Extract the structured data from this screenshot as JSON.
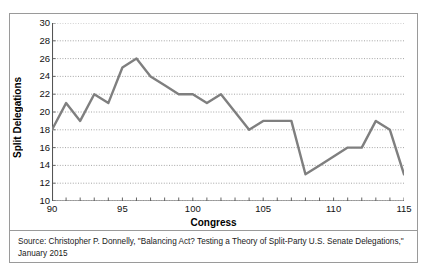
{
  "figure": {
    "source_note": "Source: Christopher P. Donnelly, \"Balancing Act? Testing a Theory of Split-Party U.S. Senate Delegations,\" January 2015"
  },
  "chart_data": {
    "type": "line",
    "title": "",
    "xlabel": "Congress",
    "ylabel": "Split Delegations",
    "xlim": [
      90,
      115
    ],
    "ylim": [
      10,
      30
    ],
    "ytick_step": 2,
    "xtick_step": 1,
    "xtick_label_step": 5,
    "grid": true,
    "grid_axis": "y",
    "legend": false,
    "line_color": "#7f7f7f",
    "grid_color": "#808080",
    "axis_color": "#555555",
    "x": [
      90,
      91,
      92,
      93,
      94,
      95,
      96,
      97,
      98,
      99,
      100,
      101,
      102,
      103,
      104,
      105,
      106,
      107,
      108,
      109,
      110,
      111,
      112,
      113,
      114,
      115
    ],
    "values": [
      18,
      21,
      19,
      22,
      21,
      25,
      26,
      24,
      23,
      22,
      22,
      21,
      22,
      20,
      18,
      19,
      19,
      19,
      13,
      14,
      15,
      16,
      16,
      19,
      18,
      13
    ],
    "yticks": [
      10,
      12,
      14,
      16,
      18,
      20,
      22,
      24,
      26,
      28,
      30
    ],
    "xticks": [
      90,
      91,
      92,
      93,
      94,
      95,
      96,
      97,
      98,
      99,
      100,
      101,
      102,
      103,
      104,
      105,
      106,
      107,
      108,
      109,
      110,
      111,
      112,
      113,
      114,
      115
    ],
    "xtick_labels": [
      {
        "value": 90,
        "label": "90"
      },
      {
        "value": 95,
        "label": "95"
      },
      {
        "value": 100,
        "label": "100"
      },
      {
        "value": 105,
        "label": "105"
      },
      {
        "value": 110,
        "label": "110"
      },
      {
        "value": 115,
        "label": "115"
      }
    ]
  }
}
